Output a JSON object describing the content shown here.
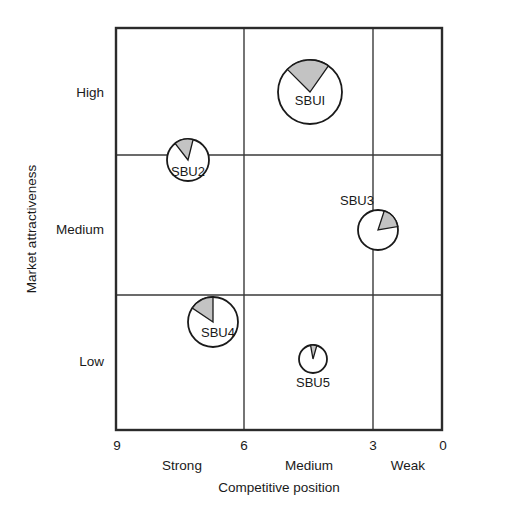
{
  "chart_data": {
    "type": "scatter",
    "title": "",
    "xlabel": "Competitive position",
    "ylabel": "Market attractiveness",
    "xlim": [
      9,
      0
    ],
    "ylim": [
      0,
      9
    ],
    "grid": true,
    "legend": "none",
    "x_tick_labels": [
      "9",
      "6",
      "3",
      "0"
    ],
    "x_tick_values": [
      9,
      6,
      3,
      0
    ],
    "x_band_labels": [
      "Strong",
      "Medium",
      "Weak"
    ],
    "y_tick_labels": [
      "High",
      "Medium",
      "Low"
    ],
    "y_band_labels": [
      "High",
      "Medium",
      "Low"
    ],
    "x_axis_direction": "reversed",
    "points": [
      {
        "name": "SBU1",
        "label": "SBUI",
        "x": 4.5,
        "y": 7.4,
        "radius_px": 32,
        "share_percent": 22,
        "share_start_deg": -45,
        "share_sweep_deg": 80,
        "cx_px": 310,
        "cy_px": 92
      },
      {
        "name": "SBU2",
        "label": "SBU2",
        "x": 6.9,
        "y": 5.9,
        "radius_px": 21,
        "share_percent": 14,
        "share_start_deg": -38,
        "share_sweep_deg": 52,
        "cx_px": 188,
        "cy_px": 160
      },
      {
        "name": "SBU3",
        "label": "SBU3",
        "x": 3.0,
        "y": 4.1,
        "radius_px": 20,
        "share_percent": 17,
        "share_start_deg": 18,
        "share_sweep_deg": 62,
        "cx_px": 378,
        "cy_px": 230
      },
      {
        "name": "SBU4",
        "label": "SBU4",
        "x": 6.3,
        "y": 2.4,
        "radius_px": 25,
        "share_percent": 15,
        "share_start_deg": -56,
        "share_sweep_deg": 56,
        "cx_px": 213,
        "cy_px": 322
      },
      {
        "name": "SBU5",
        "label": "SBU5",
        "x": 4.3,
        "y": 1.2,
        "radius_px": 14,
        "share_percent": 7,
        "share_start_deg": -10,
        "share_sweep_deg": 26,
        "cx_px": 313,
        "cy_px": 359
      }
    ],
    "colors": {
      "share_fill": "#c3c3c3",
      "bubble_stroke": "#1a1a1a",
      "bubble_fill": "#ffffff",
      "grid_line": "#3a3a3a",
      "frame": "#2b2b2b",
      "background": "#ffffff",
      "text": "#1a1a1a"
    }
  },
  "axes": {
    "y": {
      "title": "Market attractiveness",
      "ticks": [
        {
          "label": "High"
        },
        {
          "label": "Medium"
        },
        {
          "label": "Low"
        }
      ]
    },
    "x": {
      "title": "Competitive position",
      "numeric_ticks": [
        {
          "label": "9"
        },
        {
          "label": "6"
        },
        {
          "label": "3"
        },
        {
          "label": "0"
        }
      ],
      "band_labels": [
        {
          "label": "Strong"
        },
        {
          "label": "Medium"
        },
        {
          "label": "Weak"
        }
      ]
    }
  },
  "bubbles": [
    {
      "label": "SBUI"
    },
    {
      "label": "SBU2"
    },
    {
      "label": "SBU3"
    },
    {
      "label": "SBU4"
    },
    {
      "label": "SBU5"
    }
  ]
}
